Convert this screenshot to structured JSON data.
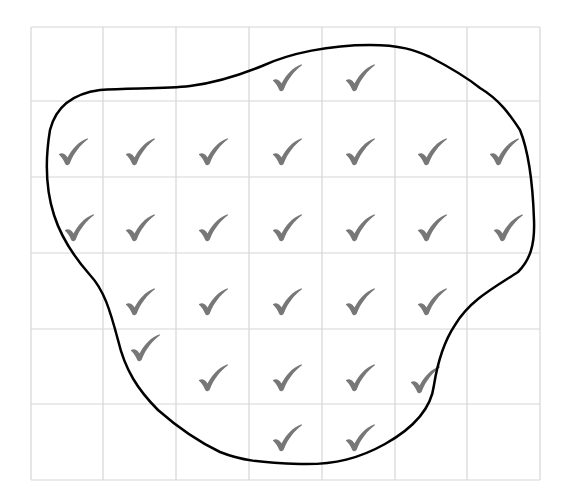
{
  "diagram": {
    "title": "",
    "grid": {
      "columns": 7,
      "rows": 6,
      "x_lines": [
        31,
        103,
        176,
        249,
        322,
        395,
        467,
        540
      ],
      "y_lines": [
        27,
        101,
        177,
        253,
        329,
        404,
        480
      ],
      "line_color": "#d6d6d6"
    },
    "outline": {
      "color": "#000000",
      "stroke_width": 2.5,
      "path": "M 100 90 C 130 88, 165 89, 190 86 C 215 83, 240 75, 262 66 C 290 53, 330 45, 370 45 C 400 45, 415 50, 430 57 C 455 70, 470 80, 480 88 C 500 100, 510 115, 520 130 C 530 155, 533 190, 534 220 C 535 245, 530 260, 518 272 C 495 287, 470 300, 455 325 C 445 340, 438 360, 434 385 C 431 410, 410 430, 385 444 C 360 458, 335 465, 300 464 C 260 463, 240 460, 220 452 C 195 440, 175 425, 158 410 C 138 390, 125 370, 118 340 C 110 310, 104 290, 90 275 C 75 258, 62 240, 54 215 C 46 190, 45 160, 50 130 C 55 110, 70 94, 100 90 Z"
    },
    "checkmark": {
      "glyph": "check-icon",
      "color": "#777777"
    },
    "checks": [
      {
        "x": 287,
        "y": 78
      },
      {
        "x": 360,
        "y": 78
      },
      {
        "x": 73,
        "y": 152
      },
      {
        "x": 140,
        "y": 152
      },
      {
        "x": 213,
        "y": 152
      },
      {
        "x": 287,
        "y": 152
      },
      {
        "x": 360,
        "y": 152
      },
      {
        "x": 432,
        "y": 152
      },
      {
        "x": 504,
        "y": 152
      },
      {
        "x": 79,
        "y": 228
      },
      {
        "x": 140,
        "y": 228
      },
      {
        "x": 213,
        "y": 228
      },
      {
        "x": 287,
        "y": 228
      },
      {
        "x": 360,
        "y": 228
      },
      {
        "x": 432,
        "y": 228
      },
      {
        "x": 508,
        "y": 228
      },
      {
        "x": 140,
        "y": 302
      },
      {
        "x": 213,
        "y": 302
      },
      {
        "x": 287,
        "y": 302
      },
      {
        "x": 360,
        "y": 302
      },
      {
        "x": 432,
        "y": 302
      },
      {
        "x": 145,
        "y": 348
      },
      {
        "x": 213,
        "y": 378
      },
      {
        "x": 287,
        "y": 378
      },
      {
        "x": 360,
        "y": 378
      },
      {
        "x": 425,
        "y": 380
      },
      {
        "x": 287,
        "y": 438
      },
      {
        "x": 360,
        "y": 438
      }
    ]
  }
}
